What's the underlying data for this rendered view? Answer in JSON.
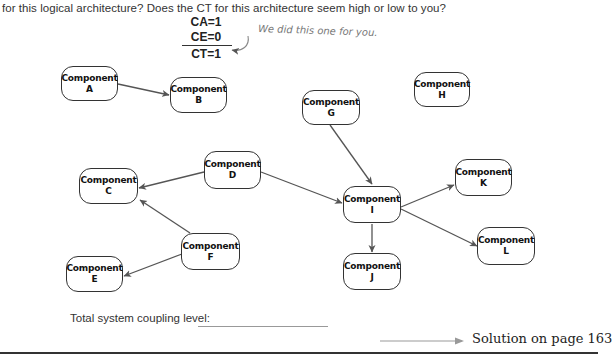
{
  "question": {
    "text": "for this logical architecture? Does the CT for this architecture seem high or low to you?"
  },
  "example_metrics": {
    "ca": "CA=1",
    "ce": "CE=0",
    "ct": "CT=1",
    "note": "We did this one for you."
  },
  "components": [
    {
      "id": "A",
      "title": "Component",
      "letter": "A"
    },
    {
      "id": "B",
      "title": "Component",
      "letter": "B"
    },
    {
      "id": "C",
      "title": "Component",
      "letter": "C"
    },
    {
      "id": "D",
      "title": "Component",
      "letter": "D"
    },
    {
      "id": "E",
      "title": "Component",
      "letter": "E"
    },
    {
      "id": "F",
      "title": "Component",
      "letter": "F"
    },
    {
      "id": "G",
      "title": "Component",
      "letter": "G"
    },
    {
      "id": "H",
      "title": "Component",
      "letter": "H"
    },
    {
      "id": "I",
      "title": "Component",
      "letter": "I"
    },
    {
      "id": "J",
      "title": "Component",
      "letter": "J"
    },
    {
      "id": "K",
      "title": "Component",
      "letter": "K"
    },
    {
      "id": "L",
      "title": "Component",
      "letter": "L"
    }
  ],
  "edges": [
    {
      "from": "A",
      "to": "B"
    },
    {
      "from": "D",
      "to": "C"
    },
    {
      "from": "D",
      "to": "I"
    },
    {
      "from": "F",
      "to": "C"
    },
    {
      "from": "F",
      "to": "E"
    },
    {
      "from": "G",
      "to": "I"
    },
    {
      "from": "I",
      "to": "J"
    },
    {
      "from": "I",
      "to": "K"
    },
    {
      "from": "I",
      "to": "L"
    }
  ],
  "footer": {
    "total_label": "Total system coupling level:",
    "total_value": "",
    "solution": "Solution on page 163"
  },
  "colors": {
    "line": "#555555",
    "border": "#333333"
  }
}
